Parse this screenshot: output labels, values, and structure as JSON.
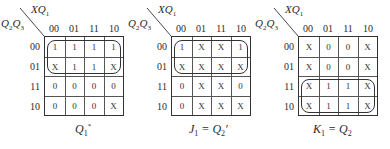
{
  "row_var_label": "Q2Q3",
  "col_var_label": "XQ1",
  "column_labels": [
    "00",
    "01",
    "11",
    "10"
  ],
  "row_labels": [
    "00",
    "01",
    "11",
    "10"
  ],
  "maps": [
    {
      "id": "q1-next",
      "caption": "Q1*",
      "cells": [
        [
          "1",
          "1",
          "1",
          "1"
        ],
        [
          "X",
          "1",
          "1",
          "X"
        ],
        [
          "0",
          "0",
          "0",
          "0"
        ],
        [
          "0",
          "0",
          "0",
          "X"
        ]
      ],
      "loop_rows": [
        0,
        1
      ]
    },
    {
      "id": "j1",
      "caption": "J1 = Q2'",
      "cells": [
        [
          "1",
          "X",
          "X",
          "1"
        ],
        [
          "X",
          "X",
          "X",
          "X"
        ],
        [
          "0",
          "X",
          "X",
          "0"
        ],
        [
          "0",
          "X",
          "X",
          "X"
        ]
      ],
      "loop_rows": [
        0,
        1
      ]
    },
    {
      "id": "k1",
      "caption": "K1 = Q2",
      "cells": [
        [
          "X",
          "0",
          "0",
          "X"
        ],
        [
          "X",
          "0",
          "0",
          "X"
        ],
        [
          "X",
          "1",
          "1",
          "X"
        ],
        [
          "X",
          "1",
          "1",
          "X"
        ]
      ],
      "loop_rows": [
        2,
        3
      ]
    }
  ]
}
